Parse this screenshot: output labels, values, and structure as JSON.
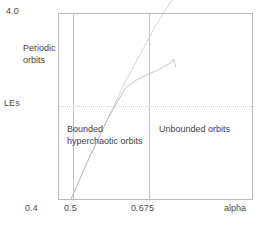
{
  "chart_data": {
    "type": "line",
    "title": "",
    "xlabel": "alpha",
    "ylabel": "LEs",
    "xlim": [
      0.375,
      0.875
    ],
    "ylim": [
      -0.55,
      4.0
    ],
    "grid": false,
    "legend": null,
    "x_ticks": [
      "0.4",
      "0.5",
      "0.675"
    ],
    "x_tick_values": [
      0.4,
      0.5,
      0.675
    ],
    "y_ticks": [
      "4.0",
      "LEs"
    ],
    "y_tick_values": [
      4.0,
      0.0
    ],
    "zero_line": {
      "y": 0.0,
      "style": "dotted",
      "color": "#cfcfcf"
    },
    "region_boundaries": [
      0.5,
      0.675
    ],
    "annotations": [
      {
        "text": "Periodic orbits",
        "x": 0.43,
        "y": 3.0
      },
      {
        "text": "Bounded hyperchaotic orbits",
        "x": 0.56,
        "y": -0.45
      },
      {
        "text": "Unbounded orbits",
        "x": 0.76,
        "y": -0.45
      }
    ],
    "series": [
      {
        "name": "LE1",
        "color": "#c8c8c8",
        "x": [
          0.405,
          0.45,
          0.5,
          0.545,
          0.585,
          0.625,
          0.665,
          0.675
        ],
        "y": [
          -0.52,
          0.45,
          1.45,
          2.35,
          3.05,
          3.75,
          4.35,
          4.5
        ]
      },
      {
        "name": "LE2",
        "color": "#b4b4b4",
        "x": [
          0.405,
          0.45,
          0.5,
          0.545,
          0.575,
          0.6,
          0.625,
          0.645,
          0.66,
          0.668,
          0.675
        ],
        "y": [
          -0.52,
          0.45,
          1.45,
          2.2,
          2.4,
          2.52,
          2.62,
          2.72,
          2.8,
          2.9,
          2.7
        ]
      }
    ]
  },
  "axes": {
    "y_top_label": "4.0",
    "y_zero_label": "LEs",
    "x_tick_1": "0.4",
    "x_tick_2": "0.5",
    "x_tick_3": "0.675",
    "x_axis_title": "alpha"
  },
  "regions": {
    "periodic_line1": "Periodic",
    "periodic_line2": "orbits",
    "bounded_line1": "Bounded",
    "bounded_line2": "hyperchaotic orbits",
    "unbounded": "Unbounded orbits"
  }
}
